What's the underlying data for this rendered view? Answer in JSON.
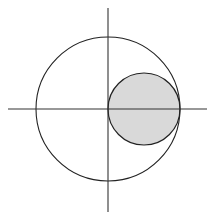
{
  "diagram": {
    "type": "geometric-figure",
    "axes": {
      "x_axis": {
        "x1": 8,
        "x2": 207,
        "y": 109
      },
      "y_axis": {
        "x": 108,
        "y1": 8,
        "y2": 212
      }
    },
    "outer_circle": {
      "cx": 108,
      "cy": 109,
      "r": 72,
      "fill": "none",
      "stroke": "#222222"
    },
    "inner_circle": {
      "cx": 144,
      "cy": 109,
      "r": 36,
      "fill": "#d9d9d9",
      "stroke": "#222222"
    },
    "colors": {
      "background": "#ffffff",
      "line": "#222222",
      "shade": "#d9d9d9"
    }
  }
}
